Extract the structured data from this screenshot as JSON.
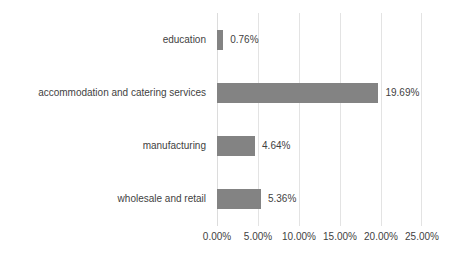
{
  "chart_data": {
    "type": "bar",
    "orientation": "horizontal",
    "title": "",
    "subtitle": "",
    "xlabel": "",
    "ylabel": "",
    "categories": [
      "education",
      "accommodation and catering services",
      "manufacturing",
      "wholesale and retail"
    ],
    "values": [
      0.76,
      19.69,
      4.64,
      5.36
    ],
    "value_labels": [
      "0.76%",
      "19.69%",
      "4.64%",
      "5.36%"
    ],
    "xlim": [
      0,
      25
    ],
    "xticks": [
      0,
      5,
      10,
      15,
      20,
      25
    ],
    "xtick_labels": [
      "0.00%",
      "5.00%",
      "10.00%",
      "15.00%",
      "20.00%",
      "25.00%"
    ],
    "grid": true,
    "grid_axis": "x",
    "legend": false,
    "legend_position": "none",
    "bar_color": "#838383",
    "grid_color": "#e3e3e3",
    "text_color": "#3f3f3f",
    "background_color": "#ffffff"
  }
}
